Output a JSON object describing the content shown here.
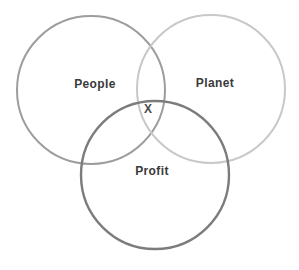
{
  "diagram": {
    "type": "venn",
    "background": "#ffffff",
    "text_color": "#3a3a3a",
    "circles": [
      {
        "label": "People",
        "color": "#9d9d9d"
      },
      {
        "label": "Planet",
        "color": "#c8c8c8"
      },
      {
        "label": "Profit",
        "color": "#7c7c7c"
      }
    ],
    "intersection": {
      "marker": "X",
      "marker_color": "#4a4a4a"
    }
  }
}
